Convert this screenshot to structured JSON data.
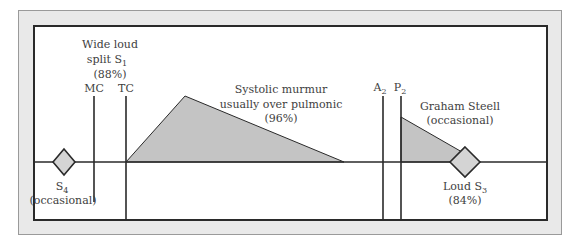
{
  "diagram": {
    "labels": {
      "s1_line1": "Wide loud",
      "s1_line2": "split S",
      "s1_sub": "1",
      "s1_pct": "(88%)",
      "mc": "MC",
      "tc": "TC",
      "murmur_line1": "Systolic murmur",
      "murmur_line2": "usually over pulmonic",
      "murmur_pct": "(96%)",
      "a2": "A",
      "a2_sub": "2",
      "p2": "P",
      "p2_sub": "2",
      "graham_line1": "Graham Steell",
      "graham_line2": "(occasional)",
      "s3_line1": "Loud S",
      "s3_sub": "3",
      "s3_pct": "(84%)",
      "s4": "S",
      "s4_sub": "4",
      "s4_note": "(occasional)"
    },
    "colors": {
      "frame_bg": "#e9e9e9",
      "panel_bg": "#ffffff",
      "line": "#2a2a2a",
      "murmur_fill": "#c4c4c4",
      "diamond_fill": "#d4d4d4"
    }
  }
}
